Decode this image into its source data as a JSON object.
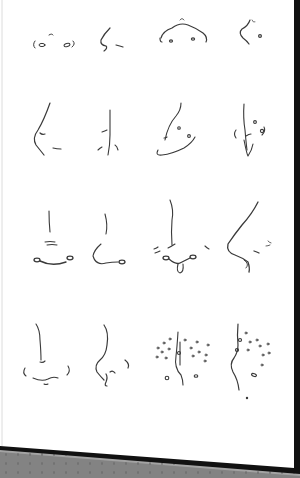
{
  "scene": {
    "subject": "Pencil sketch sheet of nose studies",
    "layout": {
      "rows": 4,
      "columns": 4
    },
    "colors": {
      "paper": "#ffffff",
      "pencil": "#3a3a3a",
      "paper_edge": "#111111",
      "surface": "#a3a3a3",
      "surface_dots": "#7d7d7d"
    },
    "rows": [
      {
        "label": "Row 1",
        "items": [
          "nostrils-front-simple",
          "nose-profile-squiggle",
          "nose-bridge-arc-front",
          "nose-profile-small-curve"
        ]
      },
      {
        "label": "Row 2",
        "items": [
          "nose-profile-line",
          "nose-front-vertical",
          "nose-three-quarter-rounded",
          "nose-front-with-piercing"
        ]
      },
      {
        "label": "Row 3",
        "items": [
          "nose-front-wide-nostrils",
          "nose-three-quarter-hook",
          "nose-front-v-septum",
          "nose-profile-long-bridge"
        ]
      },
      {
        "label": "Row 4",
        "items": [
          "nose-front-soft",
          "nose-three-quarter-curled",
          "nose-front-freckles",
          "nose-profile-freckles"
        ]
      }
    ]
  }
}
